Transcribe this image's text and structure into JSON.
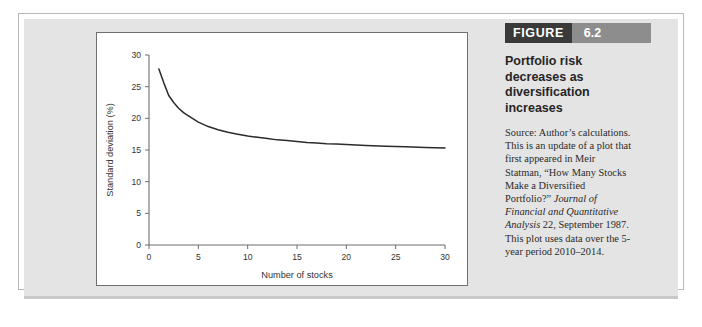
{
  "figure": {
    "banner_word": "FIGURE",
    "banner_number": "6.2",
    "title": "Portfolio risk decreases as diversification increases",
    "source_plain_1": "Source: Author’s calculations. This is an update of a plot that first appeared in Meir Statman, “How Many Stocks Make a Diversified Portfolio?” ",
    "source_italic_1": "Journal of Financial and Quantitative Analysis",
    "source_plain_2": " 22, September 1987. This plot uses data over the 5-year period 2010–2014."
  },
  "colors": {
    "banner_dark": "#3a3a3a",
    "banner_light": "#8d8d8d",
    "panel_bg": "#e4e4e4",
    "chart_bg": "#ffffff",
    "curve": "#2b2b2b",
    "axis": "#6f6f6f"
  },
  "chart_data": {
    "type": "line",
    "title": "",
    "xlabel": "Number of stocks",
    "ylabel": "Standard deviation (%)",
    "xlim": [
      0,
      30
    ],
    "ylim": [
      0,
      30
    ],
    "xticks": [
      0,
      5,
      10,
      15,
      20,
      25,
      30
    ],
    "yticks": [
      0,
      5,
      10,
      15,
      20,
      25,
      30
    ],
    "xtick_labels": [
      "0",
      "5",
      "10",
      "15",
      "20",
      "25",
      "30"
    ],
    "ytick_labels": [
      "0",
      "5",
      "10",
      "15",
      "20",
      "25",
      "30"
    ],
    "grid": false,
    "legend": "none",
    "series": [
      {
        "name": "Portfolio standard deviation",
        "x": [
          1,
          1.5,
          2,
          2.5,
          3,
          3.5,
          4,
          5,
          6,
          7,
          8,
          9,
          10,
          11,
          12,
          13,
          14,
          15,
          16,
          17,
          18,
          19,
          20,
          22,
          24,
          26,
          28,
          30
        ],
        "values": [
          27.8,
          25.6,
          23.6,
          22.5,
          21.6,
          20.9,
          20.4,
          19.4,
          18.7,
          18.2,
          17.8,
          17.5,
          17.2,
          17.0,
          16.8,
          16.6,
          16.5,
          16.35,
          16.2,
          16.1,
          16.0,
          15.95,
          15.85,
          15.7,
          15.6,
          15.5,
          15.4,
          15.3
        ]
      }
    ]
  }
}
